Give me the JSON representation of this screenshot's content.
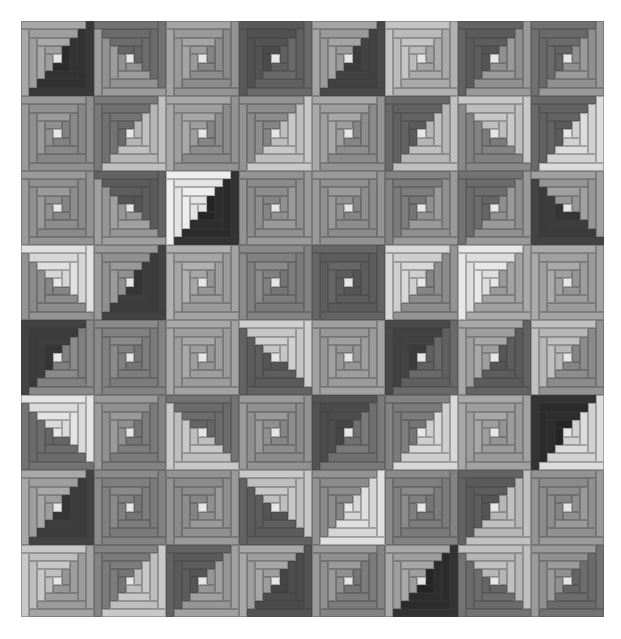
{
  "quilt": {
    "title": "Log Cabin quilt (grayscale)",
    "rows": 8,
    "cols": 8,
    "col_edges": [
      0,
      73,
      145,
      218,
      291,
      364,
      437,
      510,
      583
    ],
    "row_edges": [
      0,
      75,
      150,
      224,
      299,
      374,
      449,
      524,
      596
    ],
    "rings": 4,
    "center_color": "#e6e6e6",
    "blocks": [
      [
        [
          "#a8a8a8",
          "#303030",
          "br"
        ],
        [
          "#9c9c9c",
          "#6a6a6a",
          "tr"
        ],
        [
          "#a4a4a4",
          "#8a8a8a",
          "br"
        ],
        [
          "#6a6a6a",
          "#505050",
          "tl"
        ],
        [
          "#a4a4a4",
          "#404040",
          "br"
        ],
        [
          "#c4c4c4",
          "#a8a8a8",
          "br"
        ],
        [
          "#9a9a9a",
          "#5a5a5a",
          "tl"
        ],
        [
          "#9a9a9a",
          "#686868",
          "tl"
        ]
      ],
      [
        [
          "#9a9a9a",
          "#868686",
          "br"
        ],
        [
          "#c0c0c0",
          "#707070",
          "tl"
        ],
        [
          "#a8a8a8",
          "#8a8a8a",
          "br"
        ],
        [
          "#c8c8c8",
          "#8a8a8a",
          "tl"
        ],
        [
          "#a8a8a8",
          "#8a8a8a",
          "br"
        ],
        [
          "#c0c0c0",
          "#606060",
          "tl"
        ],
        [
          "#c8c8c8",
          "#808080",
          "bl"
        ],
        [
          "#dcdcdc",
          "#606060",
          "tl"
        ]
      ],
      [
        [
          "#9a9a9a",
          "#8a8a8a",
          "br"
        ],
        [
          "#a0a0a0",
          "#5a5a5a",
          "tr"
        ],
        [
          "#eeeeee",
          "#2a2a2a",
          "br"
        ],
        [
          "#9a9a9a",
          "#8a8a8a",
          "tl"
        ],
        [
          "#9a9a9a",
          "#8a8a8a",
          "br"
        ],
        [
          "#9a9a9a",
          "#7a7a7a",
          "tl"
        ],
        [
          "#999999",
          "#6a6a6a",
          "tl"
        ],
        [
          "#a0a0a0",
          "#3a3a3a",
          "bl"
        ]
      ],
      [
        [
          "#e0e0e0",
          "#8a8a8a",
          "bl"
        ],
        [
          "#9a9a9a",
          "#3a3a3a",
          "br"
        ],
        [
          "#b0b0b0",
          "#9a9a9a",
          "br"
        ],
        [
          "#8a8a8a",
          "#7a7a7a",
          "br"
        ],
        [
          "#666666",
          "#5a5a5a",
          "br"
        ],
        [
          "#d8d8d8",
          "#8a8a8a",
          "br"
        ],
        [
          "#e8e8e8",
          "#a0a0a0",
          "br"
        ],
        [
          "#aaaaaa",
          "#9a9a9a",
          "br"
        ]
      ],
      [
        [
          "#8a8a8a",
          "#3a3a3a",
          "tl"
        ],
        [
          "#8a8a8a",
          "#7a7a7a",
          "br"
        ],
        [
          "#a8a8a8",
          "#9a9a9a",
          "br"
        ],
        [
          "#d0d0d0",
          "#5a5a5a",
          "bl"
        ],
        [
          "#a0a0a0",
          "#9a9a9a",
          "br"
        ],
        [
          "#6a6a6a",
          "#404040",
          "tl"
        ],
        [
          "#a8a8a8",
          "#5a5a5a",
          "br"
        ],
        [
          "#c0c0c0",
          "#8a8a8a",
          "br"
        ]
      ],
      [
        [
          "#e4e4e4",
          "#6a6a6a",
          "bl"
        ],
        [
          "#9a9a9a",
          "#7a7a7a",
          "br"
        ],
        [
          "#c8c8c8",
          "#6a6a6a",
          "tr"
        ],
        [
          "#9a9a9a",
          "#8a8a8a",
          "br"
        ],
        [
          "#7a7a7a",
          "#4a4a4a",
          "tl"
        ],
        [
          "#d8d8d8",
          "#7a7a7a",
          "tl"
        ],
        [
          "#a8a8a8",
          "#999999",
          "br"
        ],
        [
          "#dcdcdc",
          "#2a2a2a",
          "tl"
        ]
      ],
      [
        [
          "#a8a8a8",
          "#3a3a3a",
          "br"
        ],
        [
          "#8a8a8a",
          "#7a7a7a",
          "br"
        ],
        [
          "#9a9a9a",
          "#8a8a8a",
          "tl"
        ],
        [
          "#c8c8c8",
          "#5a5a5a",
          "bl"
        ],
        [
          "#e0e0e0",
          "#8a8a8a",
          "tl"
        ],
        [
          "#8a8a8a",
          "#7a7a7a",
          "br"
        ],
        [
          "#c0c0c0",
          "#5a5a5a",
          "tl"
        ],
        [
          "#9a9a9a",
          "#8a8a8a",
          "tl"
        ]
      ],
      [
        [
          "#c8c8c8",
          "#9a9a9a",
          "br"
        ],
        [
          "#c8c8c8",
          "#7a7a7a",
          "tl"
        ],
        [
          "#a0a0a0",
          "#5a5a5a",
          "tl"
        ],
        [
          "#a8a8a8",
          "#4a4a4a",
          "br"
        ],
        [
          "#9a9a9a",
          "#7a7a7a",
          "br"
        ],
        [
          "#a8a8a8",
          "#2a2a2a",
          "br"
        ],
        [
          "#c0c0c0",
          "#6a6a6a",
          "bl"
        ],
        [
          "#9a9a9a",
          "#6a6a6a",
          "br"
        ]
      ]
    ]
  }
}
